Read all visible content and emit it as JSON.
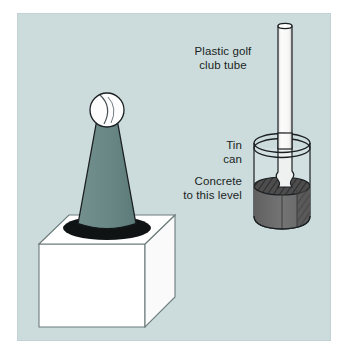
{
  "figure": {
    "width": 344,
    "height": 355,
    "panel_background": "#ccdcdd",
    "page_background": "#ffffff"
  },
  "labels": {
    "tube": "Plastic golf\nclub tube",
    "can": "Tin\ncan",
    "concrete": "Concrete\nto this level"
  },
  "objects": {
    "ball": {
      "name": "tennis ball",
      "fill": "#fdfdfd",
      "outline": "#1b1f22"
    },
    "cone": {
      "name": "traffic cone",
      "fill": "#6a8a88",
      "outline": "#1b1f22"
    },
    "cube": {
      "name": "white block base",
      "fill": "#ffffff",
      "outline": "#5d6d6c"
    },
    "tube": {
      "name": "plastic golf club tube",
      "fill": "#fbfbfb",
      "outline": "#1b1f22"
    },
    "can": {
      "name": "tin can",
      "fill": "rgba(255,255,255,0.10)",
      "outline": "#1b1f22"
    },
    "concrete": {
      "name": "concrete fill",
      "fill": "#6e6e6e",
      "top_fill": "#4a4a4a",
      "outline": "#1b1f22"
    }
  }
}
